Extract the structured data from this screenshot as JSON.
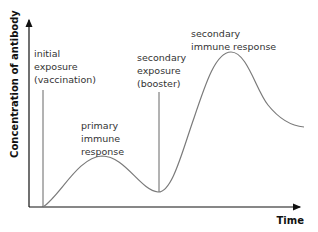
{
  "diagram": {
    "type": "line",
    "title": "",
    "xlabel": "Time",
    "ylabel": "Concentration of antibody",
    "colors": {
      "axis": "#111111",
      "curve": "#7a7a7a",
      "marker": "#555555",
      "text": "#333333"
    },
    "annotations": {
      "initial_exposure": [
        "initial",
        "exposure",
        "(vaccination)"
      ],
      "primary_response": [
        "primary",
        "immune",
        "response"
      ],
      "secondary_exposure": [
        "secondary",
        "exposure",
        "(booster)"
      ],
      "secondary_response": [
        "secondary",
        "immune response"
      ]
    },
    "events": [
      {
        "name": "initial exposure (vaccination)",
        "t": 0.05
      },
      {
        "name": "secondary exposure (booster)",
        "t": 0.47
      }
    ],
    "curve": {
      "description": "Antibody concentration over time: small primary peak after vaccination, dips, then large secondary peak after booster, then declines to a plateau above baseline",
      "points": [
        [
          0.05,
          0.0
        ],
        [
          0.12,
          0.12
        ],
        [
          0.22,
          0.27
        ],
        [
          0.33,
          0.15
        ],
        [
          0.47,
          0.08
        ],
        [
          0.57,
          0.42
        ],
        [
          0.66,
          0.82
        ],
        [
          0.73,
          0.87
        ],
        [
          0.82,
          0.68
        ],
        [
          0.91,
          0.5
        ],
        [
          0.99,
          0.45
        ]
      ]
    }
  }
}
